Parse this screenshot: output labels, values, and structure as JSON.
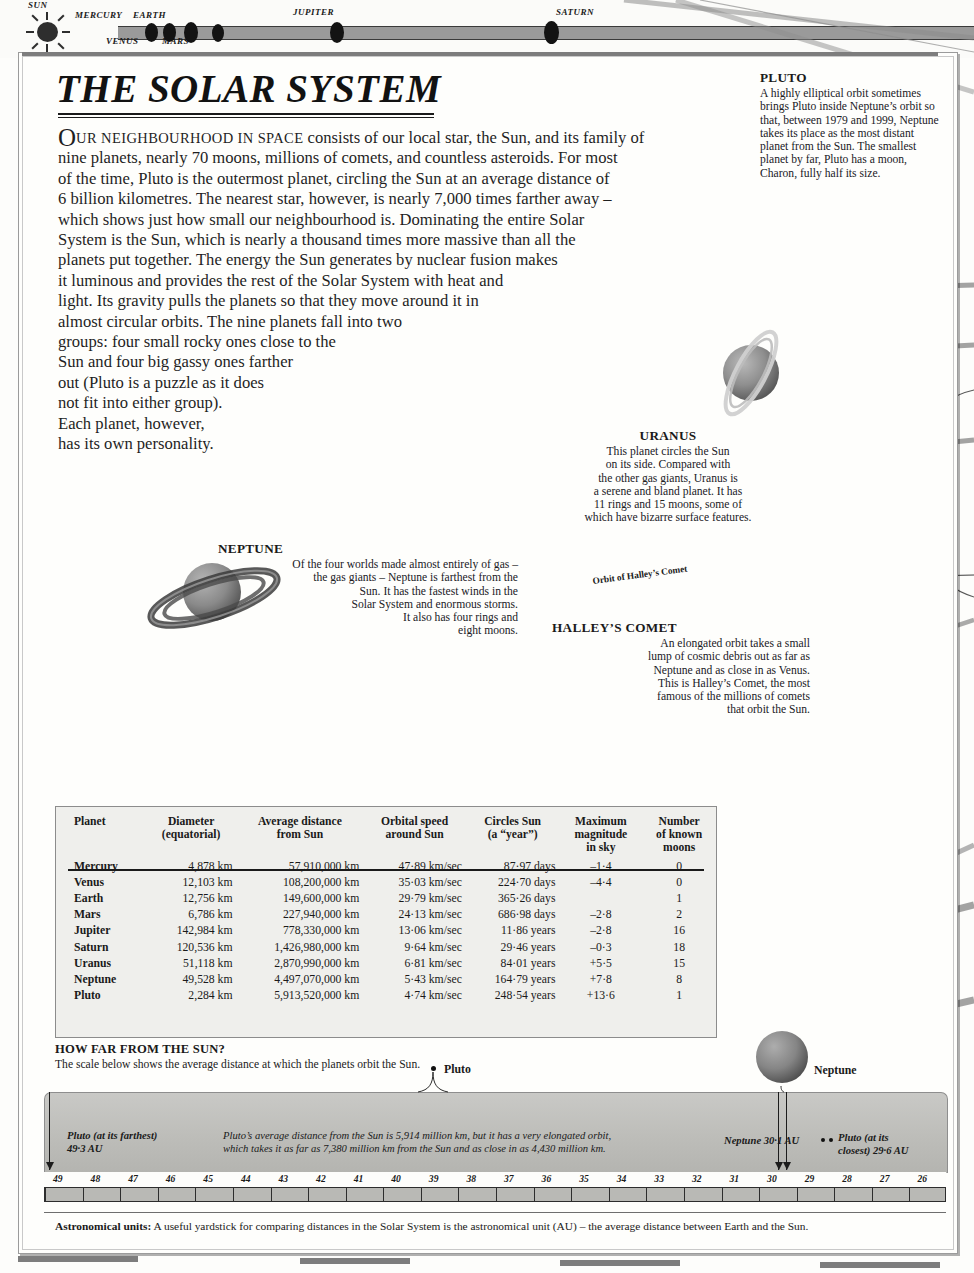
{
  "top_scale": {
    "sun_label": "SUN",
    "planets": [
      {
        "label": "MERCURY",
        "pos": "above"
      },
      {
        "label": "VENUS",
        "pos": "below"
      },
      {
        "label": "EARTH",
        "pos": "above"
      },
      {
        "label": "MARS",
        "pos": "below"
      },
      {
        "label": "JUPITER",
        "pos": "above"
      },
      {
        "label": "SATURN",
        "pos": "above"
      }
    ]
  },
  "page": {
    "title": "THE SOLAR SYSTEM",
    "intro_lines": [
      "OUR NEIGHBOURHOOD IN SPACE consists of our local star, the Sun, and its family of",
      "nine planets, nearly 70 moons, millions of comets, and countless asteroids. For most",
      "of the time, Pluto is the outermost planet, circling the Sun at an average distance of",
      "6 billion kilometres. The nearest star, however, is nearly 7,000 times farther away –",
      "which shows just how small our neighbourhood is. Dominating the entire Solar",
      "System is the Sun, which is nearly a thousand times more massive than all the",
      "planets put together. The energy the Sun generates by nuclear fusion makes",
      "it luminous and provides the rest of the Solar System with heat and",
      "light. Its gravity pulls the planets so that they move around it in",
      "almost circular orbits. The nine planets fall into two",
      "groups: four small rocky ones close to the",
      "Sun and four big gassy ones farther",
      "out (Pluto is a puzzle as it does",
      "not fit into either group).",
      "Each planet, however,",
      "has its own personality."
    ],
    "intro_dropcap": "O",
    "intro_smallcaps": "UR NEIGHBOURHOOD IN SPACE"
  },
  "captions": {
    "pluto": {
      "head": "PLUTO",
      "body": "A highly elliptical orbit sometimes brings Pluto inside Neptune’s orbit so that, between 1979 and 1999, Neptune takes its place as the most distant planet from the Sun. The smallest planet by far, Pluto has a moon, Charon, fully half its size."
    },
    "uranus": {
      "head": "URANUS",
      "lines": [
        "This planet circles the Sun",
        "on its side. Compared with",
        "the other gas giants, Uranus is",
        "a serene and bland planet. It has",
        "11 rings and 15 moons, some of",
        "which have bizarre surface features."
      ]
    },
    "neptune": {
      "head": "NEPTUNE",
      "lines": [
        "Of the four worlds made almost entirely of gas –",
        "the gas giants – Neptune is farthest from the",
        "Sun. It has the fastest winds in the",
        "Solar System and enormous storms.",
        "It also has four rings and",
        "eight moons."
      ]
    },
    "halley": {
      "head": "HALLEY’S COMET",
      "lines": [
        "An elongated orbit takes a small",
        "lump of cosmic debris out as far as",
        "Neptune and as close in as Venus.",
        "This is Halley’s Comet, the most",
        "famous of the millions of comets",
        "that orbit the Sun."
      ]
    },
    "orbit_label": "Orbit of Halley’s Comet"
  },
  "table": {
    "headers": [
      "Planet",
      "Diameter\n(equatorial)",
      "Average distance\nfrom Sun",
      "Orbital speed\naround Sun",
      "Circles Sun\n(a “year”)",
      "Maximum\nmagnitude\nin sky",
      "Number\nof known\nmoons"
    ],
    "rows": [
      {
        "planet": "Mercury",
        "diameter": "4,878 km",
        "distance": "57,910,000 km",
        "speed": "47·89 km/sec",
        "period": "87·97 days",
        "magnitude": "–1·4",
        "moons": "0"
      },
      {
        "planet": "Venus",
        "diameter": "12,103 km",
        "distance": "108,200,000 km",
        "speed": "35·03 km/sec",
        "period": "224·70 days",
        "magnitude": "–4·4",
        "moons": "0"
      },
      {
        "planet": "Earth",
        "diameter": "12,756 km",
        "distance": "149,600,000 km",
        "speed": "29·79 km/sec",
        "period": "365·26 days",
        "magnitude": "",
        "moons": "1"
      },
      {
        "planet": "Mars",
        "diameter": "6,786 km",
        "distance": "227,940,000 km",
        "speed": "24·13 km/sec",
        "period": "686·98 days",
        "magnitude": "–2·8",
        "moons": "2"
      },
      {
        "planet": "Jupiter",
        "diameter": "142,984 km",
        "distance": "778,330,000 km",
        "speed": "13·06 km/sec",
        "period": "11·86 years",
        "magnitude": "–2·8",
        "moons": "16"
      },
      {
        "planet": "Saturn",
        "diameter": "120,536 km",
        "distance": "1,426,980,000 km",
        "speed": "9·64 km/sec",
        "period": "29·46 years",
        "magnitude": "–0·3",
        "moons": "18"
      },
      {
        "planet": "Uranus",
        "diameter": "51,118 km",
        "distance": "2,870,990,000 km",
        "speed": "6·81 km/sec",
        "period": "84·01 years",
        "magnitude": "+5·5",
        "moons": "15"
      },
      {
        "planet": "Neptune",
        "diameter": "49,528 km",
        "distance": "4,497,070,000 km",
        "speed": "5·43 km/sec",
        "period": "164·79 years",
        "magnitude": "+7·8",
        "moons": "8"
      },
      {
        "planet": "Pluto",
        "diameter": "2,284 km",
        "distance": "5,913,520,000 km",
        "speed": "4·74 km/sec",
        "period": "248·54 years",
        "magnitude": "+13·6",
        "moons": "1"
      }
    ]
  },
  "howfar": {
    "head": "HOW FAR FROM THE SUN?",
    "body": "The scale below shows the average distance at which the planets orbit the Sun."
  },
  "scale": {
    "pluto_marker_label": "Pluto",
    "neptune_marker_label": "Neptune",
    "left_note_line1": "Pluto (at its farthest)",
    "left_note_line2": "49·3 AU",
    "center_note_line1": "Pluto’s average distance from the Sun is 5,914 million km, but it has a very elongated orbit,",
    "center_note_line2": "which takes it as far as 7,380 million km from the Sun and as close in as 4,430 million km.",
    "neptune_au": "Neptune 30·1 AU",
    "pluto_closest_line1": "Pluto (at its",
    "pluto_closest_line2": "closest) 29·6 AU",
    "ticks": [
      49,
      48,
      47,
      46,
      45,
      44,
      43,
      42,
      41,
      40,
      39,
      38,
      37,
      36,
      35,
      34,
      33,
      32,
      31,
      30,
      29,
      28,
      27,
      26
    ]
  },
  "footnote": {
    "bold": "Astronomical units:",
    "text": " A useful yardstick for comparing distances in the Solar System is the astronomical unit (AU) – the average distance between Earth and the Sun."
  },
  "colors": {
    "page": "#fefefc",
    "orbit_grey": "#8d8d8d",
    "band_grey": "#c2c2be",
    "ink": "#1a1a1a"
  }
}
